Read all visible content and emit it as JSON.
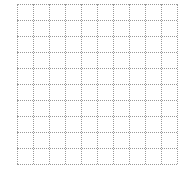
{
  "grid": {
    "rows": 10,
    "columns": 10,
    "cell_size_px": 16,
    "line_style": "dotted",
    "line_color": "#9a9a9a",
    "background": "#ffffff"
  }
}
